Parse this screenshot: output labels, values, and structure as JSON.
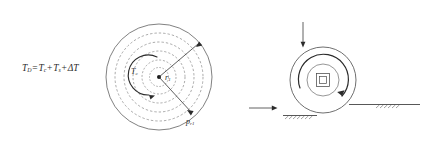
{
  "figure": {
    "title_equation": {
      "base": "T",
      "sub": "D",
      "full": "T_D = T_c + T_s + ΔT"
    },
    "left_diagram": {
      "name": "concentric-pressure-distribution",
      "equation_parts": {
        "lhs_var": "T",
        "lhs_sub": "D",
        "equals": "=",
        "term1_var": "T",
        "term1_sub": "c",
        "plus1": "+",
        "term2_var": "T",
        "term2_sub": "s",
        "plus2": "+",
        "term3": "ΔT"
      },
      "labels": {
        "contact_temp_var": "T",
        "contact_temp_sub": "c",
        "radius_var": "r",
        "radius_sub": "1",
        "pressure_var": "p",
        "pressure_sub": "r1"
      },
      "geometry": {
        "center_x": 159,
        "center_y": 77,
        "outer_radius": 53,
        "dashed_radii": [
          44,
          35,
          26,
          17,
          9
        ],
        "rotation_arrow": "counterclockwise",
        "radius_arrow_angle_deg": -40,
        "pressure_arrow_angle_deg": 42
      },
      "colors": {
        "stroke": "#4a4a4a",
        "dashed_stroke": "#7d7d7d",
        "text": "#2b2b2b"
      }
    },
    "right_diagram": {
      "name": "roller-contact-pressure",
      "labels": {
        "top_pressure_var": "p",
        "top_pressure_sub": "r1",
        "side_pressure_var": "p",
        "side_pressure_sub": "r1"
      },
      "equation_parts": {
        "lhs_var": "p",
        "lhs_sub": "r1",
        "equals": "=",
        "mu_var": "μ",
        "mu_sub": "r1",
        "rhs_var": "p",
        "rhs_sub": "r1"
      },
      "geometry": {
        "center_x": 323,
        "center_y": 80,
        "outer_radius": 33,
        "inner_radius": 16,
        "hub_outer_size": 13,
        "hub_inner_size": 7,
        "rotation_arrow": "clockwise",
        "top_arrow": "down",
        "side_arrow": "right"
      },
      "supports": [
        {
          "name": "bottom-ground-support",
          "x": 285,
          "y": 117,
          "width": 30
        },
        {
          "name": "right-ground-support",
          "x": 357,
          "y": 106,
          "width": 62
        }
      ],
      "colors": {
        "stroke": "#4a4a4a",
        "hatch": "#555555",
        "text": "#2b2b2b"
      }
    }
  }
}
